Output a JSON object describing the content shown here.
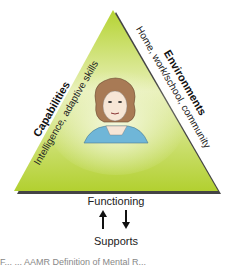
{
  "diagram": {
    "left_side": {
      "title": "Capabilities",
      "subtitle": "Intelligence, adaptive skills"
    },
    "right_side": {
      "title": "Environments",
      "subtitle": "Home, work/school, community"
    },
    "center_figure": "person-portrait",
    "bottom": {
      "top_label": "Functioning",
      "bottom_label": "Supports",
      "arrows": [
        "up-arrow",
        "down-arrow"
      ]
    },
    "colors": {
      "triangle_top": "#e6efb4",
      "triangle_bottom": "#b5d332",
      "shadow": "#444444",
      "hair": "#a87a55",
      "shirt": "#6fb6d8",
      "skin": "#f7e6d6"
    }
  },
  "caption": {
    "visible_text": "F... ... AAMR Definition of Mental R..."
  }
}
